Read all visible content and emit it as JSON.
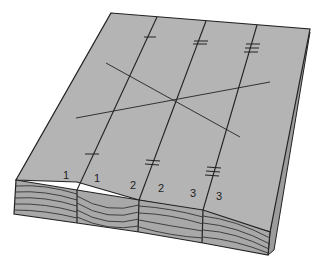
{
  "figure": {
    "strip_labels": [
      "1",
      "1",
      "2",
      "2",
      "3",
      "3"
    ],
    "colors": {
      "surface": "#b4b4b4",
      "end_grain": "#a8a8a8",
      "side": "#9c9c9c",
      "ink": "#222222",
      "background": "#ffffff"
    }
  }
}
